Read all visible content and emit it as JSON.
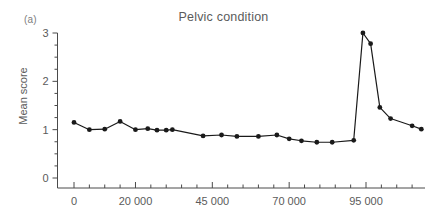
{
  "figure": {
    "panel_label": "(a)",
    "background": "#ffffff"
  },
  "chart_data": {
    "type": "line",
    "title": "Pelvic condition",
    "xlabel": "",
    "ylabel": "Mean score",
    "xlim": [
      -2500,
      116000
    ],
    "ylim": [
      0,
      3
    ],
    "grid": false,
    "legend": null,
    "line_color": "#1a1a1a",
    "marker": "circle",
    "marker_color": "#1a1a1a",
    "y_ticks_major": [
      0,
      1,
      2,
      3
    ],
    "y_tick_labels": [
      "0",
      "1",
      "2",
      "3"
    ],
    "y_minor_tick_step": 0.25,
    "x_ticks_major": [
      0,
      20000,
      45000,
      70000,
      95000
    ],
    "x_tick_labels": [
      "0",
      "20 000",
      "45 000",
      "70 000",
      "95 000"
    ],
    "x_minor_tick_step": 5000,
    "x": [
      0,
      5000,
      10000,
      15000,
      20000,
      24000,
      27000,
      30000,
      32000,
      42000,
      48000,
      53000,
      60000,
      66000,
      70000,
      74000,
      79000,
      84000,
      91000,
      94000,
      96500,
      99500,
      103000,
      110000,
      113000
    ],
    "values": [
      1.15,
      1.0,
      1.01,
      1.17,
      1.0,
      1.02,
      0.99,
      0.99,
      1.0,
      0.87,
      0.89,
      0.86,
      0.86,
      0.89,
      0.81,
      0.77,
      0.74,
      0.74,
      0.78,
      3.0,
      2.78,
      1.46,
      1.23,
      1.08,
      1.01
    ],
    "series": [
      {
        "name": "Mean score",
        "values": [
          1.15,
          1.0,
          1.01,
          1.17,
          1.0,
          1.02,
          0.99,
          0.99,
          1.0,
          0.87,
          0.89,
          0.86,
          0.86,
          0.89,
          0.81,
          0.77,
          0.74,
          0.74,
          0.78,
          3.0,
          2.78,
          1.46,
          1.23,
          1.08,
          1.01
        ]
      }
    ]
  }
}
